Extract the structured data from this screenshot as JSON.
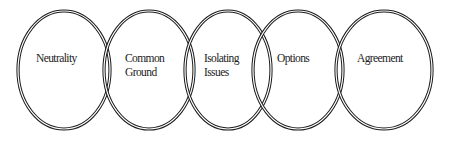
{
  "diagram": {
    "title": "",
    "stages": [
      {
        "lines": [
          "Neutrality"
        ]
      },
      {
        "lines": [
          "Common",
          "Ground"
        ]
      },
      {
        "lines": [
          "Isolating",
          "Issues"
        ]
      },
      {
        "lines": [
          "Options"
        ]
      },
      {
        "lines": [
          "Agreement"
        ]
      }
    ],
    "colors": {
      "stroke": "#1a1a1a",
      "text": "#222222",
      "background": "#ffffff"
    }
  }
}
